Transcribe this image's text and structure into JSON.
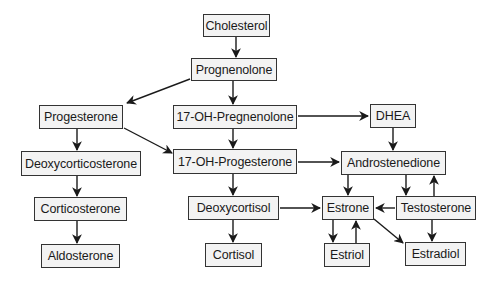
{
  "diagram": {
    "nodes": [
      {
        "id": "cholesterol",
        "label": "Cholesterol",
        "x": 203,
        "y": 14,
        "w": 67,
        "h": 23
      },
      {
        "id": "prognenolone",
        "label": "Prognenolone",
        "x": 191,
        "y": 58,
        "w": 86,
        "h": 23
      },
      {
        "id": "progesterone",
        "label": "Progesterone",
        "x": 39,
        "y": 105,
        "w": 84,
        "h": 24
      },
      {
        "id": "17-oh-pregnenolone",
        "label": "17-OH-Pregnenolone",
        "x": 173,
        "y": 105,
        "w": 124,
        "h": 24
      },
      {
        "id": "dhea",
        "label": "DHEA",
        "x": 370,
        "y": 104,
        "w": 46,
        "h": 24
      },
      {
        "id": "deoxycorticosterone",
        "label": "Deoxycorticosterone",
        "x": 21,
        "y": 151,
        "w": 120,
        "h": 25
      },
      {
        "id": "17-oh-progesterone",
        "label": "17-OH-Progesterone",
        "x": 173,
        "y": 149,
        "w": 124,
        "h": 25
      },
      {
        "id": "androstenedione",
        "label": "Androstenedione",
        "x": 341,
        "y": 151,
        "w": 105,
        "h": 24
      },
      {
        "id": "corticosterone",
        "label": "Corticosterone",
        "x": 34,
        "y": 197,
        "w": 93,
        "h": 24
      },
      {
        "id": "deoxycortisol",
        "label": "Deoxycortisol",
        "x": 188,
        "y": 196,
        "w": 91,
        "h": 24
      },
      {
        "id": "estrone",
        "label": "Estrone",
        "x": 322,
        "y": 196,
        "w": 52,
        "h": 24
      },
      {
        "id": "testosterone",
        "label": "Testosterone",
        "x": 396,
        "y": 196,
        "w": 80,
        "h": 24
      },
      {
        "id": "aldosterone",
        "label": "Aldosterone",
        "x": 41,
        "y": 244,
        "w": 79,
        "h": 24
      },
      {
        "id": "cortisol",
        "label": "Cortisol",
        "x": 205,
        "y": 243,
        "w": 57,
        "h": 24
      },
      {
        "id": "estriol",
        "label": "Estriol",
        "x": 324,
        "y": 243,
        "w": 46,
        "h": 24
      },
      {
        "id": "estradiol",
        "label": "Estradiol",
        "x": 405,
        "y": 242,
        "w": 61,
        "h": 24
      }
    ],
    "edges": [
      {
        "from": "cholesterol",
        "to": "prognenolone",
        "x1": 236,
        "y1": 37,
        "x2": 236,
        "y2": 57
      },
      {
        "from": "prognenolone",
        "to": "progesterone",
        "x1": 190,
        "y1": 79,
        "x2": 127,
        "y2": 103
      },
      {
        "from": "prognenolone",
        "to": "17-oh-pregnenolone",
        "x1": 233,
        "y1": 81,
        "x2": 233,
        "y2": 104
      },
      {
        "from": "17-oh-pregnenolone",
        "to": "dhea",
        "x1": 298,
        "y1": 116,
        "x2": 368,
        "y2": 116
      },
      {
        "from": "progesterone",
        "to": "deoxycorticosterone",
        "x1": 77,
        "y1": 129,
        "x2": 77,
        "y2": 150
      },
      {
        "from": "progesterone",
        "to": "17-oh-progesterone",
        "x1": 124,
        "y1": 128,
        "x2": 172,
        "y2": 153
      },
      {
        "from": "17-oh-pregnenolone",
        "to": "17-oh-progesterone",
        "x1": 233,
        "y1": 129,
        "x2": 233,
        "y2": 148
      },
      {
        "from": "dhea",
        "to": "androstenedione",
        "x1": 393,
        "y1": 128,
        "x2": 393,
        "y2": 150
      },
      {
        "from": "17-oh-progesterone",
        "to": "androstenedione",
        "x1": 298,
        "y1": 162,
        "x2": 339,
        "y2": 162
      },
      {
        "from": "deoxycorticosterone",
        "to": "corticosterone",
        "x1": 77,
        "y1": 176,
        "x2": 77,
        "y2": 196
      },
      {
        "from": "17-oh-progesterone",
        "to": "deoxycortisol",
        "x1": 233,
        "y1": 174,
        "x2": 233,
        "y2": 195
      },
      {
        "from": "androstenedione",
        "to": "estrone",
        "x1": 348,
        "y1": 175,
        "x2": 348,
        "y2": 195
      },
      {
        "from": "androstenedione",
        "to": "testosterone",
        "x1": 406,
        "y1": 175,
        "x2": 406,
        "y2": 195
      },
      {
        "from": "testosterone",
        "to": "androstenedione",
        "x1": 434,
        "y1": 196,
        "x2": 434,
        "y2": 176
      },
      {
        "from": "deoxycortisol",
        "to": "estrone",
        "x1": 280,
        "y1": 208,
        "x2": 320,
        "y2": 208
      },
      {
        "from": "testosterone",
        "to": "estrone",
        "x1": 395,
        "y1": 208,
        "x2": 376,
        "y2": 208
      },
      {
        "from": "corticosterone",
        "to": "aldosterone",
        "x1": 77,
        "y1": 221,
        "x2": 77,
        "y2": 243
      },
      {
        "from": "deoxycortisol",
        "to": "cortisol",
        "x1": 233,
        "y1": 220,
        "x2": 233,
        "y2": 242
      },
      {
        "from": "estrone",
        "to": "estriol",
        "x1": 333,
        "y1": 220,
        "x2": 333,
        "y2": 242
      },
      {
        "from": "estriol",
        "to": "estrone",
        "x1": 356,
        "y1": 243,
        "x2": 356,
        "y2": 221
      },
      {
        "from": "estrone",
        "to": "estradiol",
        "x1": 374,
        "y1": 219,
        "x2": 403,
        "y2": 243
      },
      {
        "from": "testosterone",
        "to": "estradiol",
        "x1": 432,
        "y1": 220,
        "x2": 432,
        "y2": 241
      }
    ]
  },
  "colors": {
    "box_fill": "#f3f3f3",
    "box_border": "#333333",
    "arrow": "#1a1a1a",
    "text": "#1a1a1a"
  }
}
